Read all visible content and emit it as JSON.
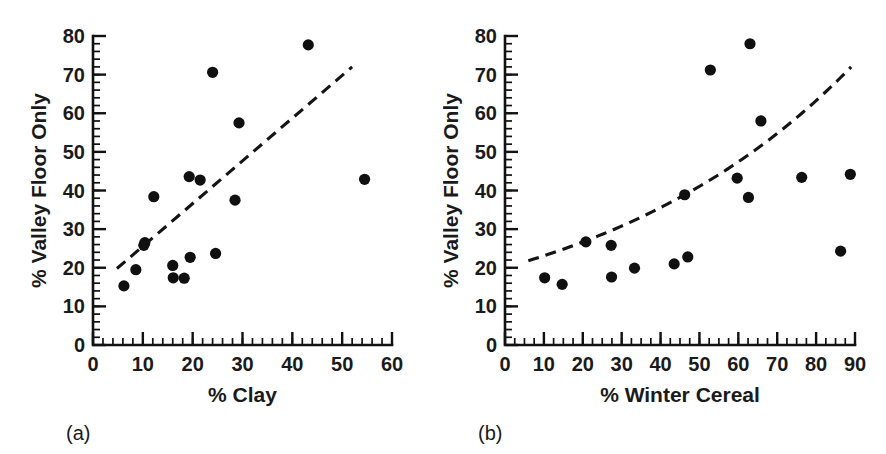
{
  "figure": {
    "background": "#ffffff",
    "point_color": "#101010",
    "axis_color": "#111111",
    "trend_color": "#141414"
  },
  "chart_data": [
    {
      "type": "scatter",
      "panel": "a",
      "caption": "(a)",
      "title": "",
      "xlabel": "% Clay",
      "ylabel": "% Valley Floor Only",
      "xlim": [
        0,
        60
      ],
      "ylim": [
        0,
        80
      ],
      "xticks": [
        0,
        10,
        20,
        30,
        40,
        50,
        60
      ],
      "xtick_labels": [
        "0",
        "10",
        "20",
        "30",
        "40",
        "50",
        "60"
      ],
      "yticks": [
        0,
        10,
        20,
        30,
        40,
        50,
        60,
        70,
        80
      ],
      "ytick_labels": [
        "0",
        "10",
        "20",
        "30",
        "40",
        "50",
        "60",
        "70",
        "80"
      ],
      "x_minor_interval": 2,
      "y_minor_interval": 2,
      "grid": false,
      "legend": "none",
      "points": [
        {
          "x": 6.2,
          "y": 15.3
        },
        {
          "x": 8.6,
          "y": 19.5
        },
        {
          "x": 10.2,
          "y": 25.8
        },
        {
          "x": 10.4,
          "y": 26.5
        },
        {
          "x": 12.2,
          "y": 38.4
        },
        {
          "x": 16.0,
          "y": 20.6
        },
        {
          "x": 16.1,
          "y": 17.4
        },
        {
          "x": 18.3,
          "y": 17.3
        },
        {
          "x": 19.3,
          "y": 43.6
        },
        {
          "x": 19.5,
          "y": 22.7
        },
        {
          "x": 21.5,
          "y": 42.7
        },
        {
          "x": 24.0,
          "y": 70.6
        },
        {
          "x": 24.6,
          "y": 23.7
        },
        {
          "x": 28.5,
          "y": 37.5
        },
        {
          "x": 29.3,
          "y": 57.5
        },
        {
          "x": 43.2,
          "y": 77.7
        },
        {
          "x": 54.5,
          "y": 42.9
        }
      ],
      "trend": {
        "style": "dashed",
        "kind": "linear",
        "x_start": 4.8,
        "x_end": 52.0,
        "y_start": 19.8,
        "y_end": 72.0
      }
    },
    {
      "type": "scatter",
      "panel": "b",
      "caption": "(b)",
      "title": "",
      "xlabel": "% Winter Cereal",
      "ylabel": "% Valley Floor Only",
      "xlim": [
        0,
        90
      ],
      "ylim": [
        0,
        80
      ],
      "xticks": [
        0,
        10,
        20,
        30,
        40,
        50,
        60,
        70,
        80,
        90
      ],
      "xtick_labels": [
        "0",
        "10",
        "20",
        "30",
        "40",
        "50",
        "60",
        "70",
        "80",
        "90"
      ],
      "yticks": [
        0,
        10,
        20,
        30,
        40,
        50,
        60,
        70,
        80
      ],
      "ytick_labels": [
        "0",
        "10",
        "20",
        "30",
        "40",
        "50",
        "60",
        "70",
        "80"
      ],
      "x_minor_interval": 2.5,
      "y_minor_interval": 2,
      "grid": false,
      "legend": "none",
      "points": [
        {
          "x": 10.2,
          "y": 17.4
        },
        {
          "x": 14.7,
          "y": 15.7
        },
        {
          "x": 20.8,
          "y": 26.7
        },
        {
          "x": 27.3,
          "y": 25.8
        },
        {
          "x": 27.4,
          "y": 17.6
        },
        {
          "x": 33.3,
          "y": 19.9
        },
        {
          "x": 43.5,
          "y": 21.0
        },
        {
          "x": 46.2,
          "y": 38.9
        },
        {
          "x": 47.0,
          "y": 22.8
        },
        {
          "x": 52.8,
          "y": 71.2
        },
        {
          "x": 59.7,
          "y": 43.2
        },
        {
          "x": 62.6,
          "y": 38.2
        },
        {
          "x": 63.0,
          "y": 78.0
        },
        {
          "x": 65.8,
          "y": 58.0
        },
        {
          "x": 76.3,
          "y": 43.4
        },
        {
          "x": 86.3,
          "y": 24.3
        },
        {
          "x": 88.8,
          "y": 44.2
        }
      ],
      "trend": {
        "style": "dashed",
        "kind": "exponential",
        "x_start": 6.0,
        "x_end": 89.0,
        "y_start": 21.8,
        "y_end": 72.0
      }
    }
  ]
}
